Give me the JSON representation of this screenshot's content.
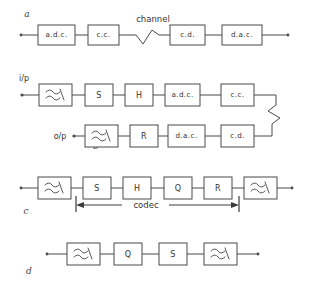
{
  "figure": {
    "stroke_color": "#4a4a4a",
    "text_color": "#333333",
    "background": "#ffffff"
  },
  "rows": {
    "a": {
      "label": "a",
      "blocks": [
        {
          "id": "a-adc",
          "text": "a.d.c."
        },
        {
          "id": "a-cc",
          "text": "c.c."
        },
        {
          "id": "a-cd",
          "text": "c.d."
        },
        {
          "id": "a-dac",
          "text": "d.a.c."
        }
      ],
      "annotations": [
        {
          "id": "a-channel",
          "text": "channel"
        }
      ]
    },
    "b": {
      "label": "b",
      "ports": [
        {
          "id": "b-input",
          "text": "i/p"
        },
        {
          "id": "b-output",
          "text": "o/p"
        }
      ],
      "blocks_top": [
        {
          "id": "b-filter-in",
          "text": "filter-symbol"
        },
        {
          "id": "b-s",
          "text": "S"
        },
        {
          "id": "b-h",
          "text": "H"
        },
        {
          "id": "b-adc",
          "text": "a.d.c."
        },
        {
          "id": "b-cc",
          "text": "c.c."
        }
      ],
      "blocks_bottom": [
        {
          "id": "b-filter-out",
          "text": "filter-symbol"
        },
        {
          "id": "b-r",
          "text": "R"
        },
        {
          "id": "b-dac",
          "text": "d.a.c."
        },
        {
          "id": "b-cd",
          "text": "c.d."
        }
      ]
    },
    "c": {
      "label": "c",
      "blocks": [
        {
          "id": "c-filter-in",
          "text": "filter-symbol"
        },
        {
          "id": "c-s",
          "text": "S"
        },
        {
          "id": "c-h",
          "text": "H"
        },
        {
          "id": "c-q",
          "text": "Q"
        },
        {
          "id": "c-r",
          "text": "R"
        },
        {
          "id": "c-filter-out",
          "text": "filter-symbol"
        }
      ],
      "annotations": [
        {
          "id": "c-codec",
          "text": "codec"
        }
      ]
    },
    "d": {
      "label": "d",
      "blocks": [
        {
          "id": "d-filter-in",
          "text": "filter-symbol"
        },
        {
          "id": "d-q",
          "text": "Q"
        },
        {
          "id": "d-s",
          "text": "S"
        },
        {
          "id": "d-filter-out",
          "text": "filter-symbol"
        }
      ]
    }
  }
}
